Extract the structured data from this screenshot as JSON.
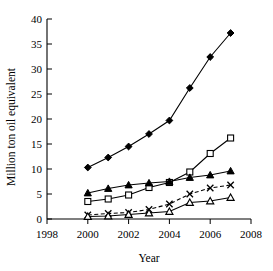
{
  "chart_data": {
    "type": "line",
    "title": "",
    "xlabel": "Year",
    "ylabel": "Million ton oil equivalent",
    "xlim": [
      1998,
      2008
    ],
    "ylim": [
      0,
      40
    ],
    "xticks": [
      1998,
      2000,
      2002,
      2004,
      2006,
      2008
    ],
    "yticks": [
      0,
      5,
      10,
      15,
      20,
      25,
      30,
      35,
      40
    ],
    "grid": false,
    "legend": "none",
    "x": [
      2000,
      2001,
      2002,
      2003,
      2004,
      2005,
      2006,
      2007
    ],
    "series": [
      {
        "name": "Series 1",
        "marker": "filled-diamond",
        "line": "solid",
        "values": [
          10.3,
          12.3,
          14.5,
          17.0,
          19.7,
          26.2,
          32.4,
          37.2
        ]
      },
      {
        "name": "Series 2",
        "marker": "open-square",
        "line": "solid",
        "values": [
          3.5,
          4.0,
          4.8,
          6.3,
          7.3,
          9.4,
          13.1,
          16.2
        ]
      },
      {
        "name": "Series 3",
        "marker": "filled-triangle",
        "line": "solid",
        "values": [
          5.2,
          6.1,
          6.8,
          7.2,
          7.5,
          8.3,
          8.8,
          9.6
        ]
      },
      {
        "name": "Series 4",
        "marker": "cross-x",
        "line": "dashed",
        "values": [
          0.8,
          1.1,
          1.3,
          1.9,
          3.0,
          5.0,
          6.2,
          6.8
        ]
      },
      {
        "name": "Series 5",
        "marker": "open-triangle",
        "line": "solid",
        "values": [
          0.5,
          0.6,
          0.9,
          1.2,
          1.5,
          3.3,
          3.6,
          4.3
        ]
      }
    ]
  },
  "axis": {
    "x_title": "Year",
    "y_title": "Million ton oil equivalent",
    "x_tick_labels": [
      "1998",
      "2000",
      "2002",
      "2004",
      "2006",
      "2008"
    ],
    "y_tick_labels": [
      "0",
      "5",
      "10",
      "15",
      "20",
      "25",
      "30",
      "35",
      "40"
    ]
  }
}
